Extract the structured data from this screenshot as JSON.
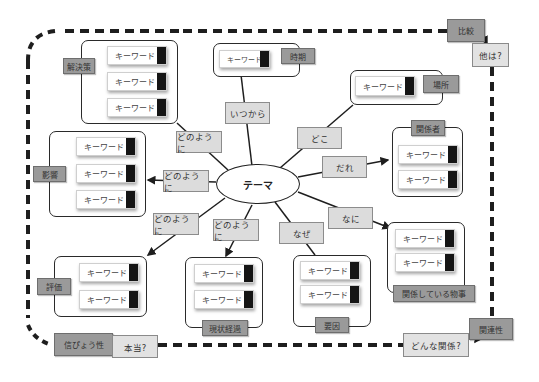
{
  "theme": "テーマ",
  "keyword_label": "キーワード",
  "connectors": {
    "when": "いつから",
    "where": "どこ",
    "who": "だれ",
    "what": "なに",
    "why": "なぜ",
    "how_solution": "どのように",
    "how_impact": "どのように",
    "how_eval": "どのように",
    "how_progress": "どのように"
  },
  "groups": {
    "solution": {
      "tag": "解決策",
      "keywords": [
        "キーワード",
        "キーワード",
        "キーワード"
      ]
    },
    "time": {
      "tag": "時期",
      "keywords": [
        "キーワード"
      ]
    },
    "place": {
      "tag": "場所",
      "keywords": [
        "キーワード"
      ]
    },
    "people": {
      "tag": "関係者",
      "keywords": [
        "キーワード",
        "キーワード"
      ]
    },
    "impact": {
      "tag": "影響",
      "keywords": [
        "キーワード",
        "キーワード",
        "キーワード"
      ]
    },
    "related": {
      "tag": "関係している物事",
      "keywords": [
        "キーワード",
        "キーワード"
      ]
    },
    "cause": {
      "tag": "要因",
      "keywords": [
        "キーワード",
        "キーワード"
      ]
    },
    "progress": {
      "tag": "現状経過",
      "keywords": [
        "キーワード",
        "キーワード"
      ]
    },
    "evaluation": {
      "tag": "評価",
      "keywords": [
        "キーワード",
        "キーワード"
      ]
    }
  },
  "frame_corners": {
    "top_right": {
      "tag": "比較",
      "question": "他は?"
    },
    "bottom_right": {
      "tag": "関連性",
      "question": "どんな関係?"
    },
    "bottom_left": {
      "tag": "信ぴょう性",
      "question": "本当?"
    }
  },
  "colors": {
    "tag_fill": "#9a9a9a",
    "connector_fill": "#dcdcdc",
    "keyword_tab": "#151515",
    "line": "#1e1e1e"
  }
}
